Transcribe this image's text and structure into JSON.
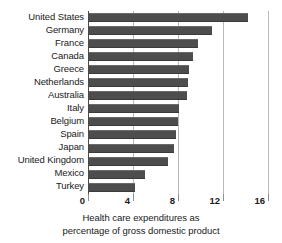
{
  "chart_data": {
    "type": "bar",
    "orientation": "horizontal",
    "title": "",
    "subtitle": "",
    "xlabel": "Health care expenditures as percentage of gross domestic product",
    "ylabel": "",
    "xlim": [
      0,
      16
    ],
    "xticks": [
      0,
      4,
      8,
      12,
      16
    ],
    "xtick_labels": [
      "0",
      "4",
      "8",
      "12",
      "16"
    ],
    "grid": "vertical",
    "legend": "none",
    "bar_color": "#4d4d4d",
    "categories": [
      "United States",
      "Germany",
      "France",
      "Canada",
      "Greece",
      "Netherlands",
      "Australia",
      "Italy",
      "Belgium",
      "Spain",
      "Japan",
      "United Kingdom",
      "Mexico",
      "Turkey"
    ],
    "values": [
      14.2,
      11.0,
      9.8,
      9.3,
      9.0,
      8.9,
      8.8,
      8.1,
      8.0,
      7.8,
      7.6,
      7.1,
      5.1,
      4.2
    ]
  },
  "caption": {
    "line1": "Health care expenditures as",
    "line2": "percentage of gross domestic product"
  }
}
